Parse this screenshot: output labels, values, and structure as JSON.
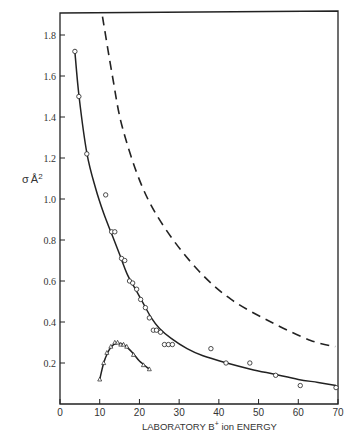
{
  "chart_data": {
    "type": "scatter",
    "title": "",
    "xlabel": "LABORATORY B+ ion ENERGY",
    "xlabel_parts": {
      "pre": "LABORATORY B",
      "sup": "+",
      "post": " ion ENERGY"
    },
    "ylabel": "σ Å2",
    "ylabel_parts": {
      "sigma": "σ",
      "unit": "Å",
      "sup": "2"
    },
    "xlim": [
      0,
      70
    ],
    "ylim": [
      0,
      1.9
    ],
    "grid": false,
    "legend": null,
    "x_ticks": [
      0,
      10,
      20,
      30,
      40,
      50,
      60,
      70
    ],
    "x_tick_labels": [
      "0",
      "10",
      "20",
      "30",
      "40",
      "50",
      "60",
      "70"
    ],
    "y_ticks": [
      0.2,
      0.4,
      0.6,
      0.8,
      1.0,
      1.2,
      1.4,
      1.6,
      1.8
    ],
    "y_tick_labels": [
      "0.2",
      "0.4",
      "0.6",
      "0.8",
      "1.0",
      "1.2",
      "1.4",
      "1.6",
      "1.8"
    ],
    "series": [
      {
        "name": "circles (measured)",
        "marker": "circle",
        "points": [
          [
            3.75,
            1.72
          ],
          [
            4.75,
            1.5
          ],
          [
            6.75,
            1.22
          ],
          [
            11.5,
            1.02
          ],
          [
            13.0,
            0.84
          ],
          [
            13.8,
            0.84
          ],
          [
            15.5,
            0.71
          ],
          [
            16.3,
            0.7
          ],
          [
            17.5,
            0.6
          ],
          [
            18.3,
            0.59
          ],
          [
            19.3,
            0.56
          ],
          [
            20.3,
            0.51
          ],
          [
            21.5,
            0.47
          ],
          [
            22.5,
            0.42
          ],
          [
            23.5,
            0.36
          ],
          [
            24.3,
            0.36
          ],
          [
            25.3,
            0.35
          ],
          [
            26.3,
            0.29
          ],
          [
            27.3,
            0.29
          ],
          [
            28.3,
            0.29
          ],
          [
            38.0,
            0.27
          ],
          [
            41.8,
            0.2
          ],
          [
            47.8,
            0.2
          ],
          [
            54.3,
            0.14
          ],
          [
            60.5,
            0.09
          ],
          [
            69.5,
            0.08
          ]
        ]
      },
      {
        "name": "solid fit curve",
        "style": "solid",
        "points": [
          [
            3.7,
            1.73
          ],
          [
            4.8,
            1.5
          ],
          [
            6.8,
            1.22
          ],
          [
            9.0,
            1.05
          ],
          [
            11.0,
            0.93
          ],
          [
            13.0,
            0.83
          ],
          [
            15.0,
            0.73
          ],
          [
            17.0,
            0.63
          ],
          [
            19.0,
            0.56
          ],
          [
            21.0,
            0.49
          ],
          [
            23.0,
            0.42
          ],
          [
            25.0,
            0.37
          ],
          [
            28.0,
            0.32
          ],
          [
            32.0,
            0.27
          ],
          [
            36.0,
            0.235
          ],
          [
            42.0,
            0.2
          ],
          [
            48.0,
            0.17
          ],
          [
            54.0,
            0.145
          ],
          [
            60.0,
            0.12
          ],
          [
            65.0,
            0.105
          ],
          [
            69.5,
            0.09
          ]
        ]
      },
      {
        "name": "dashed curve",
        "style": "dashed",
        "points": [
          [
            10.7,
            1.89
          ],
          [
            13.2,
            1.6
          ],
          [
            15.7,
            1.35
          ],
          [
            20.7,
            1.06
          ],
          [
            26.7,
            0.85
          ],
          [
            34.9,
            0.65
          ],
          [
            43.1,
            0.51
          ],
          [
            53.1,
            0.4
          ],
          [
            63.1,
            0.31
          ],
          [
            69.3,
            0.28
          ]
        ]
      },
      {
        "name": "triangles (measured)",
        "marker": "triangle",
        "points": [
          [
            10.0,
            0.12
          ],
          [
            11.0,
            0.2
          ],
          [
            11.8,
            0.25
          ],
          [
            12.8,
            0.28
          ],
          [
            13.8,
            0.3
          ],
          [
            14.5,
            0.3
          ],
          [
            15.3,
            0.29
          ],
          [
            16.0,
            0.29
          ],
          [
            16.8,
            0.28
          ],
          [
            18.5,
            0.24
          ],
          [
            21.0,
            0.19
          ],
          [
            22.5,
            0.17
          ]
        ]
      },
      {
        "name": "triangle fit curve",
        "style": "solid",
        "points": [
          [
            10.0,
            0.12
          ],
          [
            11.0,
            0.2
          ],
          [
            12.0,
            0.25
          ],
          [
            13.0,
            0.28
          ],
          [
            14.0,
            0.295
          ],
          [
            15.0,
            0.295
          ],
          [
            16.0,
            0.29
          ],
          [
            17.0,
            0.275
          ],
          [
            18.5,
            0.245
          ],
          [
            20.0,
            0.21
          ],
          [
            22.5,
            0.17
          ]
        ]
      }
    ],
    "colors": {
      "ink": "#222222",
      "background": "#ffffff"
    }
  }
}
